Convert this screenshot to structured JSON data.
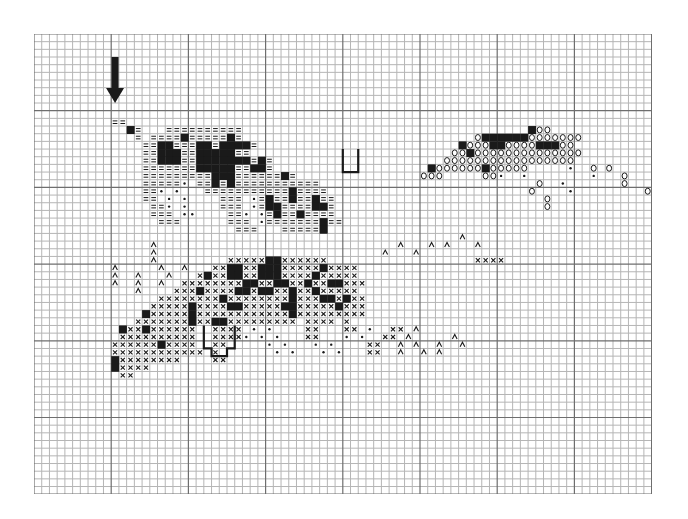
{
  "chart_data": {
    "type": "table",
    "title": "",
    "grid": {
      "cols": 80,
      "rows": 60,
      "major_every": 10,
      "cell_w": 7.72,
      "cell_h": 7.67
    },
    "legend": {
      "#": "filled-square",
      "=": "double-dash",
      "o": "circle",
      "x": "cross",
      "^": "caret",
      "*": "dot"
    },
    "arrow": {
      "col": 10.5,
      "row_start": 3,
      "row_end": 9,
      "direction": "down"
    },
    "colors": {
      "ink": "#1a1a1a",
      "grid_minor": "#b5b5b5",
      "grid_major": "#6e6e6e",
      "paper": "#ffffff"
    },
    "rows": {
      "11": "..........==..........................................................................",
      "12": "............#=...==========.....................................#oo.......................",
      "13": ".............=.====#=====#=..............................o######ooooooo...........",
      "14": "..............==##===##=####=..........................#ooo##oooo###oo..............",
      "15": "..............==###==#####==..........................oo#oooooooooooooo............",
      "16": "..............==###==#######=#=......................ooooooooooooooooo..............",
      "17": "..............=======#####==##=....................#oooooo#ooooo.....*..o.o........",
      "18": "..............=========###======#=................ooo.....oo*..*........*...o.......",
      "19": "..............=====*.==#=#===========............................o..*.......o.......",
      "20": "..............==*.*...===========#====..........................o....*.........o....",
      "21": "..............==.*.*....===.*=#==#==#==...........................o...................",
      "22": "...............==*.*....===.*=##====##=...........................o...................",
      "23": "...............===.**....==*.*=#==#====..........................................",
      "24": "................===......===.*=======#==.........................................",
      "25": "..........................===...=====#.........................................",
      "26": ".......................................................^.........................",
      "27": "...............^...............................^...^.^...^.........................",
      "28": "...............^.............................^...^.............................",
      "29": "...............^.........xxxxx##xxxxxx...................xxxx.......................",
      "30": "..........^.....^..^...xx##xx###xxxxx#xxxx.................................",
      "31": "..........^..^...^...x#xx##xx###xxxx#xxxxx........................................",
      "32": "..........^..^..^..xxxxxxxx##xx##xx#xx##xxx......................................",
      "33": ".............^....xxx#xxxx##x##xx#xx#xxxxx........................................",
      "34": "................xxxxxxxx#xxxxxxxx#xxx##x#xx.......................................",
      "35": "...............xxxxx#xxxx##xxxxx##xxxxx#xxx.......................................",
      "36": "..............#xxxxx#xxxxxxxxxxxx#xxxxxxxxx.......................................",
      "37": ".............xxxxxxx#xx##xxxxxxxxx.xxxx.x..........................................",
      "38": "...........#xx#xxxxxx..xxxx.*.*....xx...xx.*..xx.^.................................",
      "39": "...........xxxxxxxxxx..xxxx*.*.*...xx...*.*..xx.^.....^...........................",
      "40": "..........xxxxxx#xxxx..xx.....*.*...*.*....xx..^.^..^..^..........................",
      "41": "..........xxxxxxxxxxxx.x.......*.*...*.*...xx..^..^.^.............................",
      "42": "..........#xxxxxxxx....xx.........................................................",
      "43": "..........#xxxx..................................................................",
      "44": "...........xx.....................................................................",
      "45": ".................................................................................."
    },
    "outlines": [
      {
        "name": "upper-notch",
        "points": [
          [
            40,
            15
          ],
          [
            40,
            18
          ],
          [
            42,
            18
          ],
          [
            42,
            15
          ]
        ]
      },
      {
        "name": "boot-outline",
        "points": [
          [
            22,
            38
          ],
          [
            22,
            41
          ],
          [
            23,
            41
          ],
          [
            23,
            42
          ],
          [
            25,
            42
          ],
          [
            25,
            41
          ],
          [
            26,
            41
          ],
          [
            26,
            38
          ]
        ]
      }
    ]
  }
}
